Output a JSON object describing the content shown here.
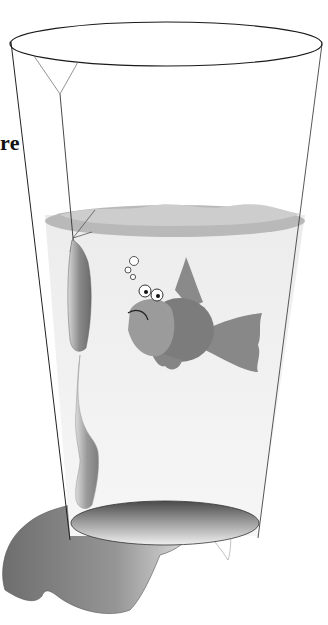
{
  "caption": {
    "fragment": "re"
  },
  "illustration": {
    "subject": "sad fish in a glass of water with a leaking bag hanging on a string",
    "elements": [
      "glass-rim",
      "glass-walls",
      "water-surface",
      "string",
      "hanging-bag",
      "drip",
      "fish",
      "bubbles",
      "glass-base",
      "spill-shadow",
      "spill-puddle"
    ]
  },
  "colors": {
    "background": "#ffffff",
    "outline": "#222222",
    "water_surface": "#b8b8b8",
    "water_surface_light": "#cfcfcf",
    "water_body": "#f2f2f2",
    "fish_body": "#7d7d7d",
    "fish_face": "#9a9a9a",
    "fish_fin": "#888888",
    "bag": "#8c8c8c",
    "shadow": "#8a8a8a"
  }
}
